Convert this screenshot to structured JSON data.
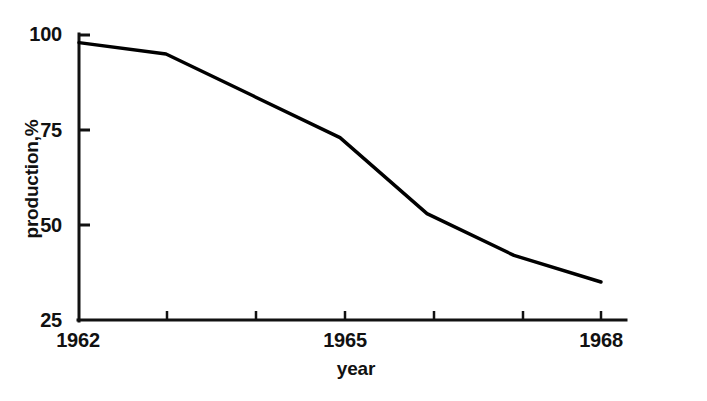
{
  "chart_data": {
    "type": "line",
    "title": "",
    "xlabel": "year",
    "ylabel": "production,%",
    "x": [
      1962,
      1963,
      1964,
      1965,
      1966,
      1967,
      1968
    ],
    "series": [
      {
        "name": "production",
        "values": [
          98,
          95,
          84,
          73,
          53,
          42,
          35
        ]
      }
    ],
    "xlim": [
      1962,
      1968
    ],
    "ylim": [
      25,
      100
    ],
    "x_tick_values": [
      1962,
      1963,
      1964,
      1965,
      1966,
      1967,
      1968
    ],
    "x_tick_labels": [
      "1962",
      "",
      "",
      "1965",
      "",
      "",
      "1968"
    ],
    "y_tick_values": [
      25,
      50,
      75,
      100
    ],
    "y_tick_labels": [
      "25",
      "50",
      "75",
      "100"
    ],
    "grid": false,
    "legend": false,
    "legend_position": "none",
    "line_color": "#000000",
    "background_color": "#ffffff"
  },
  "axes": {
    "y_labels": {
      "t100": "100",
      "t75": "75",
      "t50": "50",
      "t25": "25"
    },
    "x_labels": {
      "start": "1962",
      "middle": "1965",
      "end": "1968"
    },
    "y_title": "production,%",
    "x_title": "year"
  }
}
